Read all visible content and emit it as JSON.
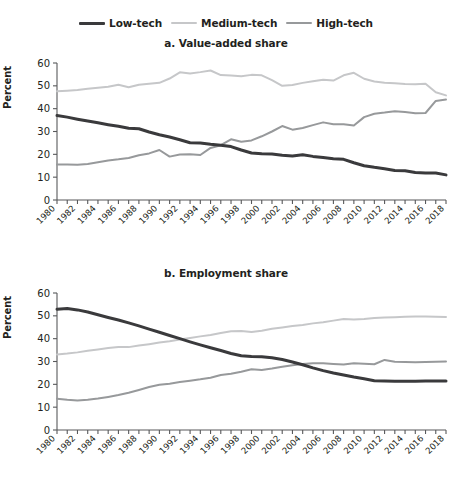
{
  "legend": {
    "position": "top-center",
    "items": [
      {
        "label": "Low-tech",
        "color": "#3a3a3c",
        "width": 3.0
      },
      {
        "label": "Medium-tech",
        "color": "#c6c7c9",
        "width": 2.0
      },
      {
        "label": "High-tech",
        "color": "#97999b",
        "width": 2.0
      }
    ]
  },
  "axis": {
    "ylabel": "Percent",
    "yticks": [
      0,
      10,
      20,
      30,
      40,
      50,
      60
    ],
    "ylim": [
      0,
      60
    ],
    "xticklabels": [
      "1980",
      "1982",
      "1984",
      "1986",
      "1988",
      "1990",
      "1992",
      "1994",
      "1996",
      "1998",
      "2000",
      "2002",
      "2004",
      "2006",
      "2008",
      "2010",
      "2012",
      "2014",
      "2016",
      "2018"
    ],
    "xlim": [
      1980,
      2018
    ],
    "grid": false
  },
  "chart_data": [
    {
      "type": "line",
      "title": "a. Value-added share",
      "xlabel": "",
      "ylabel": "Percent",
      "ylim": [
        0,
        60
      ],
      "yticks": [
        0,
        10,
        20,
        30,
        40,
        50,
        60
      ],
      "grid": false,
      "legend_position": "top-center",
      "x": [
        1980,
        1981,
        1982,
        1983,
        1984,
        1985,
        1986,
        1987,
        1988,
        1989,
        1990,
        1991,
        1992,
        1993,
        1994,
        1995,
        1996,
        1997,
        1998,
        1999,
        2000,
        2001,
        2002,
        2003,
        2004,
        2005,
        2006,
        2007,
        2008,
        2009,
        2010,
        2011,
        2012,
        2013,
        2014,
        2015,
        2016,
        2017,
        2018
      ],
      "series": [
        {
          "name": "Low-tech",
          "color": "#3a3a3c",
          "values": [
            37.0,
            36.3,
            35.4,
            34.6,
            33.8,
            33.0,
            32.3,
            31.4,
            31.2,
            29.8,
            28.6,
            27.6,
            26.4,
            25.1,
            25.0,
            24.4,
            24.0,
            23.4,
            21.9,
            20.6,
            20.3,
            20.1,
            19.6,
            19.3,
            19.8,
            19.1,
            18.6,
            18.1,
            17.8,
            16.3,
            15.0,
            14.3,
            13.7,
            12.9,
            12.8,
            12.0,
            11.8,
            11.8,
            11.0
          ]
        },
        {
          "name": "Medium-tech",
          "color": "#c6c7c9",
          "values": [
            47.6,
            47.9,
            48.2,
            48.7,
            49.2,
            49.6,
            50.5,
            49.4,
            50.5,
            50.9,
            51.3,
            53.2,
            55.9,
            55.4,
            56.0,
            56.7,
            54.7,
            54.5,
            54.2,
            54.8,
            54.6,
            52.5,
            50.0,
            50.4,
            51.3,
            52.0,
            52.7,
            52.3,
            54.6,
            55.7,
            53.1,
            51.9,
            51.4,
            51.1,
            50.8,
            50.7,
            50.9,
            47.2,
            45.8
          ]
        },
        {
          "name": "High-tech",
          "color": "#97999b",
          "values": [
            15.5,
            15.6,
            15.4,
            15.8,
            16.5,
            17.3,
            17.8,
            18.4,
            19.6,
            20.4,
            21.9,
            19.0,
            19.9,
            20.0,
            19.7,
            22.8,
            24.0,
            26.6,
            25.5,
            26.1,
            27.9,
            30.0,
            32.4,
            30.8,
            31.5,
            32.8,
            34.0,
            33.2,
            33.2,
            32.6,
            36.3,
            37.8,
            38.3,
            38.9,
            38.5,
            38.0,
            38.1,
            43.4,
            44.0
          ]
        }
      ]
    },
    {
      "type": "line",
      "title": "b. Employment share",
      "xlabel": "",
      "ylabel": "Percent",
      "ylim": [
        0,
        60
      ],
      "yticks": [
        0,
        10,
        20,
        30,
        40,
        50,
        60
      ],
      "grid": false,
      "legend_position": "top-center",
      "x": [
        1980,
        1981,
        1982,
        1983,
        1984,
        1985,
        1986,
        1987,
        1988,
        1989,
        1990,
        1991,
        1992,
        1993,
        1994,
        1995,
        1996,
        1997,
        1998,
        1999,
        2000,
        2001,
        2002,
        2003,
        2004,
        2005,
        2006,
        2007,
        2008,
        2009,
        2010,
        2011,
        2012,
        2013,
        2014,
        2015,
        2016,
        2017,
        2018
      ],
      "series": [
        {
          "name": "Low-tech",
          "color": "#3a3a3c",
          "values": [
            52.9,
            53.2,
            52.6,
            51.7,
            50.5,
            49.3,
            48.2,
            46.9,
            45.6,
            44.2,
            42.8,
            41.4,
            40.0,
            38.6,
            37.3,
            36.0,
            34.8,
            33.5,
            32.5,
            32.2,
            32.1,
            31.6,
            30.9,
            29.8,
            28.6,
            27.2,
            26.0,
            25.0,
            24.1,
            23.2,
            22.4,
            21.6,
            21.5,
            21.4,
            21.4,
            21.4,
            21.5,
            21.5,
            21.5
          ]
        },
        {
          "name": "Medium-tech",
          "color": "#c6c7c9",
          "values": [
            33.1,
            33.5,
            34.0,
            34.7,
            35.3,
            35.9,
            36.4,
            36.3,
            37.0,
            37.6,
            38.3,
            38.9,
            39.6,
            40.3,
            41.0,
            41.6,
            42.5,
            43.2,
            43.4,
            42.9,
            43.5,
            44.3,
            44.9,
            45.5,
            46.0,
            46.7,
            47.2,
            47.9,
            48.6,
            48.4,
            48.6,
            49.0,
            49.3,
            49.4,
            49.6,
            49.7,
            49.7,
            49.6,
            49.5
          ]
        },
        {
          "name": "High-tech",
          "color": "#97999b",
          "values": [
            13.7,
            13.2,
            12.9,
            13.2,
            13.8,
            14.5,
            15.3,
            16.3,
            17.5,
            18.8,
            19.8,
            20.3,
            21.0,
            21.6,
            22.2,
            22.9,
            24.1,
            24.6,
            25.5,
            26.6,
            26.3,
            26.9,
            27.7,
            28.4,
            28.9,
            29.2,
            29.2,
            28.9,
            28.7,
            29.2,
            29.0,
            28.8,
            30.7,
            29.9,
            29.8,
            29.7,
            29.8,
            29.9,
            30.0
          ]
        }
      ]
    }
  ]
}
